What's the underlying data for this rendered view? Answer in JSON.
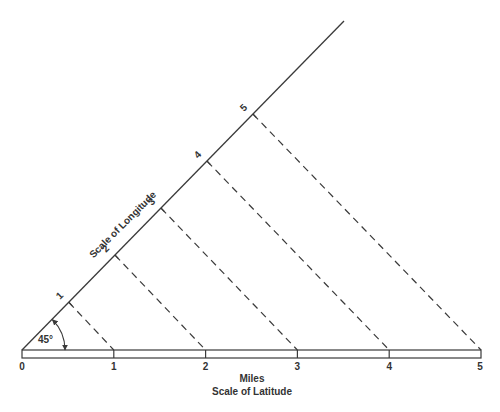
{
  "diagram": {
    "type": "geometric-construction",
    "angle_label": "45°",
    "latitude_scale": {
      "title_line1": "Miles",
      "title_line2": "Scale of Latitude",
      "ticks": [
        "0",
        "1",
        "2",
        "3",
        "4",
        "5"
      ]
    },
    "longitude_scale": {
      "title": "Scale of Longitude",
      "ticks": [
        "1",
        "2",
        "3",
        "4",
        "5"
      ]
    },
    "colors": {
      "line": "#3a3a3a",
      "text": "#333333",
      "background": "#ffffff"
    }
  }
}
